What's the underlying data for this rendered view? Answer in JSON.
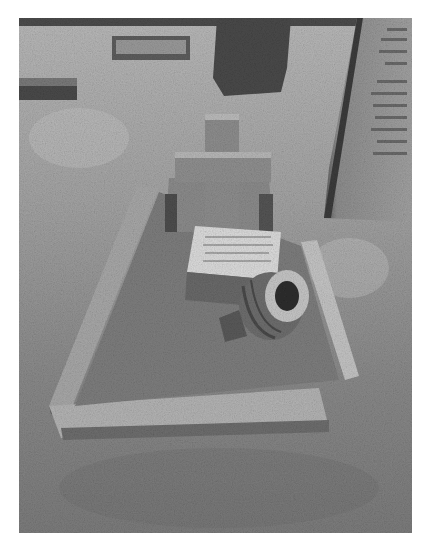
{
  "image": {
    "description": "Black and white photograph of an old grave in a grassy churchyard",
    "colors": {
      "background": "#ffffff",
      "grass_dark": "#6e6e6e",
      "grass_light": "#bdbdbd",
      "stone": "#9a9a9a",
      "stone_light": "#d6d6d6",
      "stone_dark": "#3e3e3e"
    }
  },
  "scene": {
    "foreground": "Rectangular stone grave kerb border enclosing overgrown grass",
    "center": "Stone cross headstone with inscribed plaque leaning forward",
    "vase": "Fallen round stone flower vase lying beside the plaque",
    "right": "Tall upright headstone with weathered, illegible inscription",
    "background": "Further graves and a dark tree trunk in the distance"
  }
}
